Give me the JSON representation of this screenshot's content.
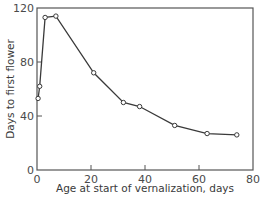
{
  "chart_data": {
    "type": "line",
    "title": "",
    "xlabel": "Age at start of vernalization, days",
    "ylabel": "Days to first flower",
    "xlim": [
      0,
      80
    ],
    "ylim": [
      0,
      120
    ],
    "xticks": [
      0,
      20,
      40,
      60,
      80
    ],
    "yticks": [
      0,
      40,
      80,
      120
    ],
    "grid": false,
    "legend": null,
    "markers": "open-circle",
    "series": [
      {
        "name": "Days to first flower",
        "x": [
          0.4,
          1,
          3,
          7,
          21,
          32,
          38,
          51,
          63,
          74
        ],
        "y": [
          53,
          62,
          113,
          114,
          72,
          50,
          47,
          33,
          27,
          26
        ]
      }
    ]
  },
  "colors": {
    "line": "#3a3a3a",
    "frame": "#555555",
    "background": "#ffffff"
  }
}
